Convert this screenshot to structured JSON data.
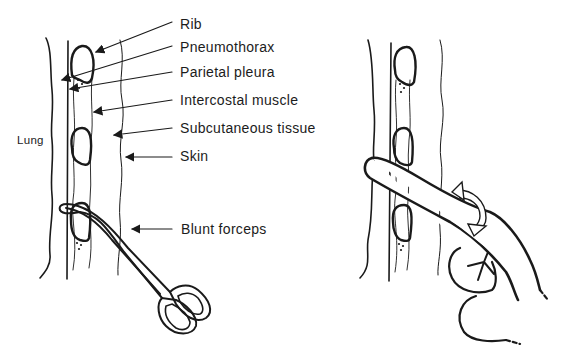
{
  "figure": {
    "left_panel": {
      "step": "blunt dissection with forceps",
      "labels": [
        {
          "id": "rib",
          "text": "Rib",
          "x": 180,
          "y": 16
        },
        {
          "id": "pneumothorax",
          "text": "Pneumothorax",
          "x": 180,
          "y": 39
        },
        {
          "id": "parietal_pleura",
          "text": "Parietal pleura",
          "x": 180,
          "y": 64
        },
        {
          "id": "intercostal_muscle",
          "text": "Intercostal muscle",
          "x": 180,
          "y": 92
        },
        {
          "id": "subcutaneous_tissue",
          "text": "Subcutaneous tissue",
          "x": 180,
          "y": 120
        },
        {
          "id": "skin",
          "text": "Skin",
          "x": 180,
          "y": 148
        },
        {
          "id": "blunt_forceps",
          "text": "Blunt forceps",
          "x": 181,
          "y": 221
        }
      ],
      "side_label": {
        "text": "Lung",
        "x": 17,
        "y": 132
      }
    },
    "right_panel": {
      "step": "finger sweep through intercostal opening",
      "elements": [
        "chest-wall-layers",
        "index-finger",
        "rotation-arrow"
      ]
    },
    "colors": {
      "line": "#1a1a1a",
      "background": "#ffffff"
    }
  }
}
